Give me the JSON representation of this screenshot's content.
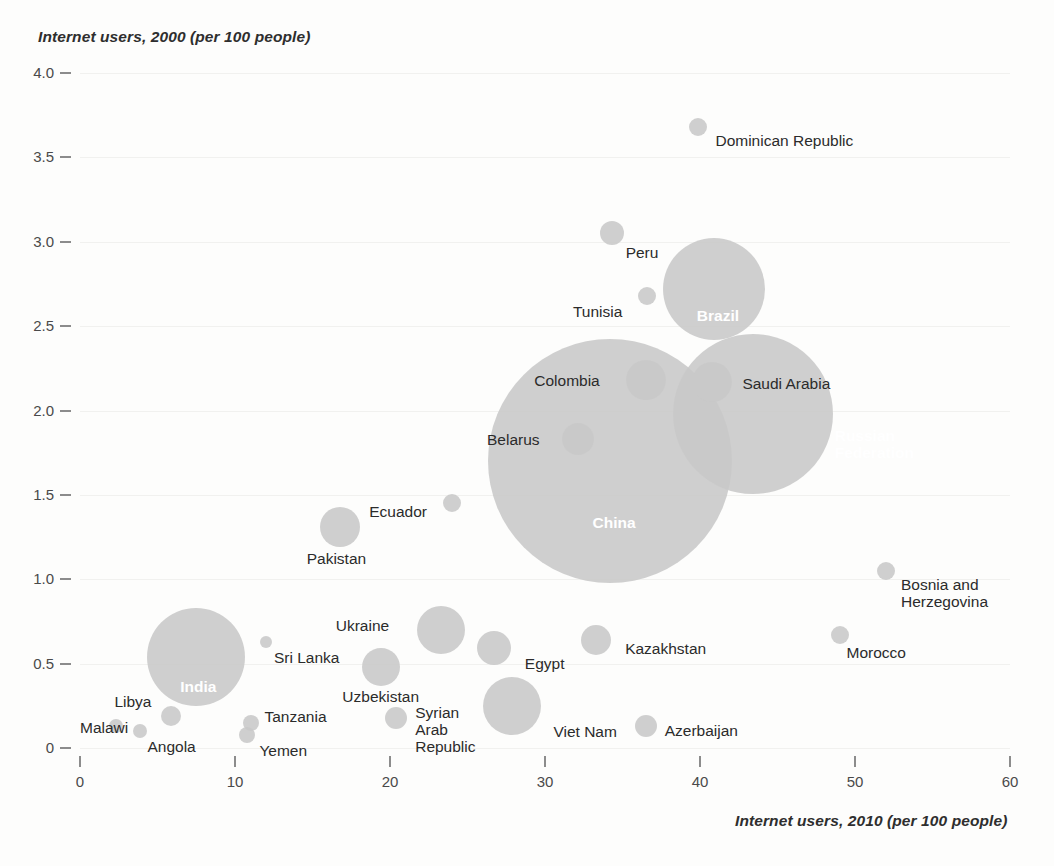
{
  "chart_data": {
    "type": "scatter",
    "title": "",
    "xlabel": "Internet users, 2010 (per 100 people)",
    "ylabel": "Internet users, 2000 (per 100 people)",
    "xlim": [
      0,
      60
    ],
    "ylim": [
      0,
      4.0
    ],
    "xticks": [
      0,
      10,
      20,
      30,
      40,
      50,
      60
    ],
    "yticks": [
      "0",
      "0.5",
      "1.0",
      "1.5",
      "2.0",
      "2.5",
      "3.0",
      "3.5",
      "4.0"
    ],
    "grid": false,
    "legend": "none",
    "bubble_color": "#c8c8c8",
    "size_encodes": "number of internet users (population scaled)",
    "points": [
      {
        "name": "Dominican Republic",
        "x": 39.9,
        "y": 3.68,
        "r": 9,
        "label_pos": "right",
        "inside": false
      },
      {
        "name": "Peru",
        "x": 34.3,
        "y": 3.05,
        "r": 12,
        "label_pos": "below-right",
        "inside": false
      },
      {
        "name": "Brazil",
        "x": 40.9,
        "y": 2.72,
        "r": 51,
        "label_pos": "inside",
        "inside": true
      },
      {
        "name": "Tunisia",
        "x": 36.6,
        "y": 2.68,
        "r": 9,
        "label_pos": "left",
        "inside": false
      },
      {
        "name": "Saudi Arabia",
        "x": 40.8,
        "y": 2.17,
        "r": 20,
        "label_pos": "right",
        "inside": false
      },
      {
        "name": "Colombia",
        "x": 36.5,
        "y": 2.18,
        "r": 20,
        "label_pos": "left",
        "inside": false
      },
      {
        "name": "Russian Federation",
        "x": 43.4,
        "y": 1.98,
        "r": 80,
        "label_pos": "inside",
        "inside": true
      },
      {
        "name": "Belarus",
        "x": 32.1,
        "y": 1.83,
        "r": 16,
        "label_pos": "left",
        "inside": false
      },
      {
        "name": "China",
        "x": 34.2,
        "y": 1.7,
        "r": 122,
        "label_pos": "inside",
        "inside": true
      },
      {
        "name": "Ecuador",
        "x": 24.0,
        "y": 1.45,
        "r": 9,
        "label_pos": "left",
        "inside": false
      },
      {
        "name": "Pakistan",
        "x": 16.8,
        "y": 1.31,
        "r": 20,
        "label_pos": "below-right",
        "inside": false
      },
      {
        "name": "Bosnia and Herzegovina",
        "x": 52.0,
        "y": 1.05,
        "r": 9,
        "label_pos": "below-right",
        "inside": false
      },
      {
        "name": "Ukraine",
        "x": 23.3,
        "y": 0.7,
        "r": 24,
        "label_pos": "left",
        "inside": false
      },
      {
        "name": "Morocco",
        "x": 49.0,
        "y": 0.67,
        "r": 9,
        "label_pos": "below-right",
        "inside": false
      },
      {
        "name": "Kazakhstan",
        "x": 33.3,
        "y": 0.64,
        "r": 15,
        "label_pos": "right",
        "inside": false
      },
      {
        "name": "Sri Lanka",
        "x": 12.0,
        "y": 0.63,
        "r": 6,
        "label_pos": "below-right",
        "inside": false
      },
      {
        "name": "Egypt",
        "x": 26.7,
        "y": 0.59,
        "r": 17,
        "label_pos": "below-right",
        "inside": false
      },
      {
        "name": "India",
        "x": 7.5,
        "y": 0.54,
        "r": 49,
        "label_pos": "inside",
        "inside": true
      },
      {
        "name": "Uzbekistan",
        "x": 19.4,
        "y": 0.48,
        "r": 19,
        "label_pos": "below-left",
        "inside": false
      },
      {
        "name": "Viet Nam",
        "x": 27.9,
        "y": 0.25,
        "r": 29,
        "label_pos": "below-right",
        "inside": false
      },
      {
        "name": "Libya",
        "x": 5.9,
        "y": 0.19,
        "r": 10,
        "label_pos": "above-left",
        "inside": false
      },
      {
        "name": "Malawi",
        "x": 2.3,
        "y": 0.13,
        "r": 7,
        "label_pos": "left",
        "inside": false
      },
      {
        "name": "Angola",
        "x": 3.9,
        "y": 0.1,
        "r": 7,
        "label_pos": "below-right",
        "inside": false
      },
      {
        "name": "Azerbaijan",
        "x": 36.5,
        "y": 0.13,
        "r": 11,
        "label_pos": "right",
        "inside": false
      },
      {
        "name": "Syrian Arab Republic",
        "x": 20.4,
        "y": 0.18,
        "r": 11,
        "label_pos": "right",
        "inside": false
      },
      {
        "name": "Tanzania",
        "x": 11.0,
        "y": 0.15,
        "r": 8,
        "label_pos": "right",
        "inside": false
      },
      {
        "name": "Yemen",
        "x": 10.8,
        "y": 0.08,
        "r": 8,
        "label_pos": "below-right",
        "inside": false
      }
    ]
  },
  "axis": {
    "y_title": "Internet users, 2000 (per 100 people)",
    "x_title": "Internet users, 2010 (per 100 people)",
    "y_ticks": [
      "4.0",
      "3.5",
      "3.0",
      "2.5",
      "2.0",
      "1.5",
      "1.0",
      "0.5",
      "0"
    ],
    "x_ticks": [
      "0",
      "10",
      "20",
      "30",
      "40",
      "50",
      "60"
    ]
  },
  "labels": {
    "dominican_republic": "Dominican Republic",
    "peru": "Peru",
    "brazil": "Brazil",
    "tunisia": "Tunisia",
    "saudi_arabia": "Saudi Arabia",
    "colombia": "Colombia",
    "russian_federation_line1": "Russian",
    "russian_federation_line2": "Federation",
    "belarus": "Belarus",
    "china": "China",
    "ecuador": "Ecuador",
    "pakistan": "Pakistan",
    "bosnia_line1": "Bosnia and",
    "bosnia_line2": "Herzegovina",
    "ukraine": "Ukraine",
    "morocco": "Morocco",
    "kazakhstan": "Kazakhstan",
    "sri_lanka": "Sri Lanka",
    "egypt": "Egypt",
    "india": "India",
    "uzbekistan": "Uzbekistan",
    "viet_nam": "Viet Nam",
    "libya": "Libya",
    "malawi": "Malawi",
    "angola": "Angola",
    "azerbaijan": "Azerbaijan",
    "syria_line1": "Syrian",
    "syria_line2": "Arab",
    "syria_line3": "Republic",
    "tanzania": "Tanzania",
    "yemen": "Yemen"
  }
}
